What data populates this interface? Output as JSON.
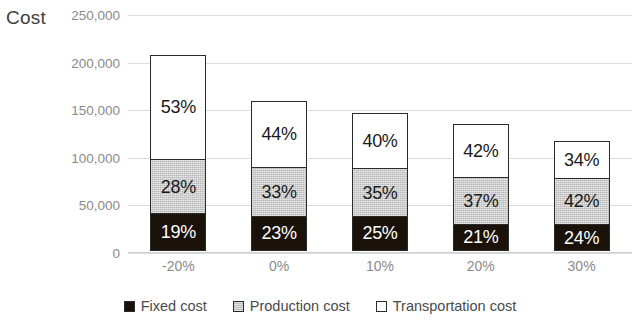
{
  "axis_title": "Cost",
  "chart_data": {
    "type": "bar",
    "subtype": "stacked-column",
    "title": "",
    "xlabel": "",
    "ylabel": "Cost",
    "ylim": [
      0,
      250000
    ],
    "yticks": [
      "0",
      "50,000",
      "100,000",
      "150,000",
      "200,000",
      "250,000"
    ],
    "ytick_values": [
      0,
      50000,
      100000,
      150000,
      200000,
      250000
    ],
    "grid": true,
    "legend_position": "bottom",
    "categories": [
      "-20%",
      "0%",
      "10%",
      "20%",
      "30%"
    ],
    "totals": [
      208000,
      160000,
      147000,
      135000,
      118000
    ],
    "series": [
      {
        "name": "Fixed cost",
        "color": "#1a1209",
        "values": [
          39520,
          36800,
          36750,
          28350,
          28320
        ],
        "percent_labels": [
          "19%",
          "23%",
          "25%",
          "21%",
          "24%"
        ],
        "percents": [
          19,
          23,
          25,
          21,
          24
        ]
      },
      {
        "name": "Production cost",
        "color": "#c9c9c9",
        "values": [
          58240,
          52800,
          51450,
          49950,
          49560
        ],
        "percent_labels": [
          "28%",
          "33%",
          "35%",
          "37%",
          "42%"
        ],
        "percents": [
          28,
          33,
          35,
          37,
          42
        ]
      },
      {
        "name": "Transportation cost",
        "color": "#ffffff",
        "values": [
          110240,
          70400,
          58800,
          56700,
          40120
        ],
        "percent_labels": [
          "53%",
          "44%",
          "40%",
          "42%",
          "34%"
        ],
        "percents": [
          53,
          44,
          40,
          42,
          34
        ]
      }
    ]
  }
}
